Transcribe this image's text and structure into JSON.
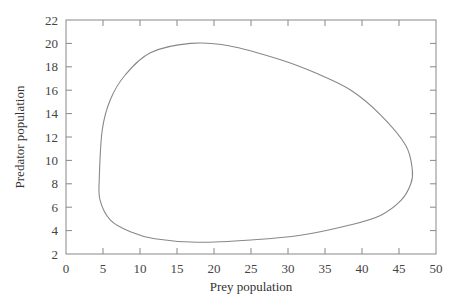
{
  "chart_data": {
    "type": "line",
    "title": "",
    "xlabel": "Prey population",
    "ylabel": "Predator population",
    "xlim": [
      0,
      50
    ],
    "ylim": [
      2,
      22
    ],
    "xticks": [
      0,
      5,
      10,
      15,
      20,
      25,
      30,
      35,
      40,
      45,
      50
    ],
    "yticks": [
      2,
      4,
      6,
      8,
      10,
      12,
      14,
      16,
      18,
      20,
      22
    ],
    "grid": false,
    "legend": null,
    "series": [
      {
        "name": "Predator-prey phase trajectory (closed orbit)",
        "closed": true,
        "x": [
          4.5,
          4.9,
          6.0,
          8.0,
          11.4,
          16.8,
          22.0,
          29.0,
          34.0,
          38.5,
          42.5,
          45.9,
          46.8,
          46.6,
          45.3,
          42.5,
          38.5,
          31.7,
          25.0,
          17.7,
          12.0,
          8.7,
          6.0,
          4.6
        ],
        "y": [
          8.5,
          12.6,
          15.2,
          17.3,
          19.2,
          20.0,
          19.8,
          18.6,
          17.4,
          16.0,
          13.9,
          11.3,
          9.2,
          8.0,
          6.6,
          5.3,
          4.5,
          3.6,
          3.2,
          3.0,
          3.3,
          3.9,
          4.9,
          6.6
        ]
      }
    ]
  },
  "plot": {
    "line_color": "#888888",
    "axis_color": "#888888"
  }
}
